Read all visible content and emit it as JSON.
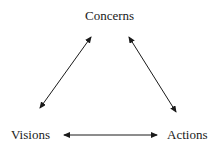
{
  "diagram": {
    "type": "triangle-cycle",
    "nodes": [
      {
        "id": "concerns",
        "label": "Concerns"
      },
      {
        "id": "visions",
        "label": "Visions"
      },
      {
        "id": "actions",
        "label": "Actions"
      }
    ],
    "edges": [
      {
        "from": "concerns",
        "to": "visions",
        "direction": "bidirectional"
      },
      {
        "from": "concerns",
        "to": "actions",
        "direction": "bidirectional"
      },
      {
        "from": "visions",
        "to": "actions",
        "direction": "bidirectional"
      }
    ],
    "colors": {
      "stroke": "#1a1a1a",
      "text": "#1a1a1a",
      "background": "#ffffff"
    }
  }
}
